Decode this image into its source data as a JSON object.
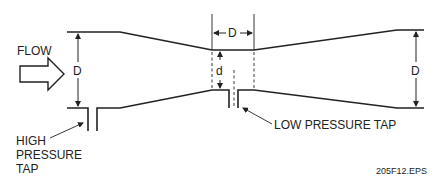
{
  "diagram": {
    "type": "venturi-tube-cross-section",
    "labels": {
      "flow": "FLOW",
      "inlet_diameter": "D",
      "throat_length": "D",
      "throat_diameter": "d",
      "outlet_diameter": "D",
      "high_tap_line1": "HIGH",
      "high_tap_line2": "PRESSURE",
      "high_tap_line3": "TAP",
      "low_tap": "LOW PRESSURE TAP",
      "figure_id": "205F12.EPS"
    },
    "colors": {
      "stroke": "#222222",
      "background": "#ffffff"
    }
  }
}
